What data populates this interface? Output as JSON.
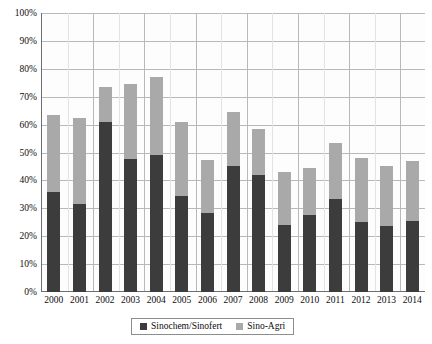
{
  "chart_data": {
    "type": "bar",
    "stacked": true,
    "title": "",
    "xlabel": "",
    "ylabel": "",
    "ylim": [
      0,
      100
    ],
    "ytick_labels": [
      "0%",
      "10%",
      "20%",
      "30%",
      "40%",
      "50%",
      "60%",
      "70%",
      "80%",
      "90%",
      "100%"
    ],
    "ytick_values": [
      0,
      10,
      20,
      30,
      40,
      50,
      60,
      70,
      80,
      90,
      100
    ],
    "grid": true,
    "legend_position": "bottom",
    "categories": [
      "2000",
      "2001",
      "2002",
      "2003",
      "2004",
      "2005",
      "2006",
      "2007",
      "2008",
      "2009",
      "2010",
      "2011",
      "2012",
      "2013",
      "2014"
    ],
    "series": [
      {
        "name": "Sinochem/Sinofert",
        "color": "#3c3c3c",
        "values": [
          36,
          31.5,
          61,
          47.5,
          49,
          34.5,
          28.5,
          45,
          42,
          24,
          27.5,
          33.5,
          25,
          23.5,
          25.5
        ]
      },
      {
        "name": "Sino-Agri",
        "color": "#a9a9a9",
        "values": [
          27.5,
          31,
          12.5,
          27,
          28,
          26.5,
          19,
          19.5,
          16.5,
          19,
          17,
          20,
          23,
          21.5,
          21.5
        ]
      }
    ],
    "totals": [
      63.5,
      62.5,
      73.5,
      74.5,
      77,
      61,
      47.5,
      64.5,
      58.5,
      43,
      44.5,
      53.5,
      48,
      45,
      47
    ]
  },
  "legend": {
    "items": [
      {
        "label": "Sinochem/Sinofert",
        "color": "#3c3c3c"
      },
      {
        "label": "Sino-Agri",
        "color": "#a9a9a9"
      }
    ]
  },
  "colors": {
    "dark": "#3c3c3c",
    "light": "#a9a9a9",
    "grid": "#b9b9b9",
    "axis": "#6e6e6e",
    "text": "#0d0d0d",
    "plot_bg": "#fdfdfd"
  }
}
